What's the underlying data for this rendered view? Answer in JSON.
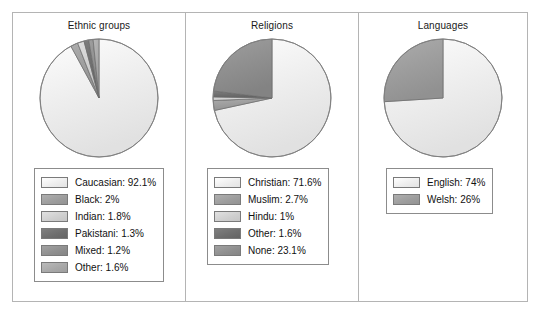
{
  "figure": {
    "border_color": "#b4b4b4",
    "background": "#ffffff"
  },
  "chart_data": [
    {
      "type": "pie",
      "title": "Ethnic groups",
      "categories": [
        "Caucasian",
        "Black",
        "Indian",
        "Pakistani",
        "Mixed",
        "Other"
      ],
      "values": [
        92.1,
        2,
        1.8,
        1.3,
        1.2,
        1.6
      ],
      "value_suffix": "%",
      "legend_entries": [
        "Caucasian: 92.1%",
        "Black: 2%",
        "Indian: 1.8%",
        "Pakistani: 1.3%",
        "Mixed: 1.2%",
        "Other: 1.6%"
      ],
      "colors": [
        "#ededed",
        "#9d9d9d",
        "#cfcfcf",
        "#6e6e6e",
        "#8f8f8f",
        "#a8a8a8"
      ],
      "legend_position": "below",
      "start_angle": 0,
      "direction": "clockwise"
    },
    {
      "type": "pie",
      "title": "Religions",
      "categories": [
        "Christian",
        "Muslim",
        "Hindu",
        "Other",
        "None"
      ],
      "values": [
        71.6,
        2.7,
        1,
        1.6,
        23.1
      ],
      "value_suffix": "%",
      "legend_entries": [
        "Christian: 71.6%",
        "Muslim: 2.7%",
        "Hindu: 1%",
        "Other: 1.6%",
        "None: 23.1%"
      ],
      "colors": [
        "#ededed",
        "#9d9d9d",
        "#cfcfcf",
        "#6e6e6e",
        "#8f8f8f"
      ],
      "legend_position": "below",
      "start_angle": 0,
      "direction": "clockwise"
    },
    {
      "type": "pie",
      "title": "Languages",
      "categories": [
        "English",
        "Welsh"
      ],
      "values": [
        74,
        26
      ],
      "value_suffix": "%",
      "legend_entries": [
        "English: 74%",
        "Welsh: 26%"
      ],
      "colors": [
        "#ededed",
        "#9d9d9d"
      ],
      "legend_position": "below",
      "start_angle": 0,
      "direction": "clockwise"
    }
  ]
}
